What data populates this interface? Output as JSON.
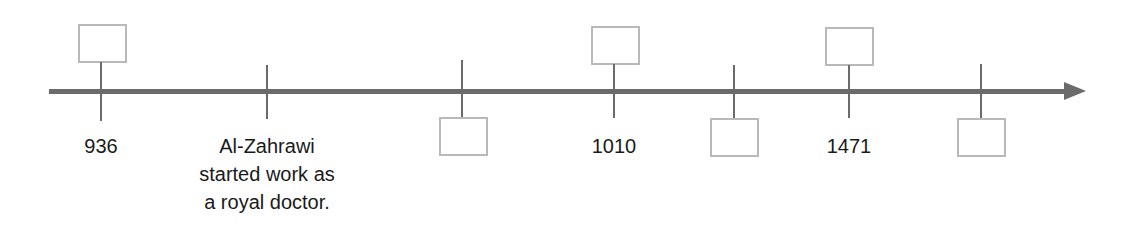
{
  "timeline": {
    "colors": {
      "axis": "#6b6b6b",
      "box_border": "#b9b9b9",
      "text": "#1a1a1a"
    },
    "events": [
      {
        "id": "e1",
        "label": "936",
        "box": "above",
        "box_content": ""
      },
      {
        "id": "e2",
        "label_lines": [
          "Al-Zahrawi",
          "started work as",
          "a royal doctor."
        ],
        "box": "none"
      },
      {
        "id": "e3",
        "label": "",
        "box": "below",
        "box_content": ""
      },
      {
        "id": "e4",
        "label": "1010",
        "box": "above",
        "box_content": ""
      },
      {
        "id": "e5",
        "label": "",
        "box": "below",
        "box_content": ""
      },
      {
        "id": "e6",
        "label": "1471",
        "box": "above",
        "box_content": ""
      },
      {
        "id": "e7",
        "label": "",
        "box": "below",
        "box_content": ""
      }
    ]
  }
}
